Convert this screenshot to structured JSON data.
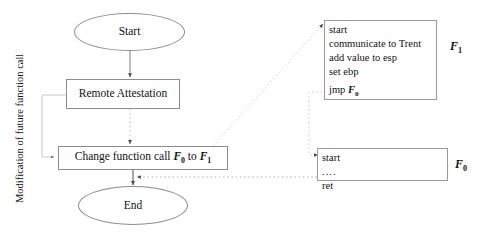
{
  "figure": {
    "side_label": "Modification of future function call",
    "background_color": "#ffffff",
    "line_color": "#8d8d8d",
    "dotted_color": "#b9b9b9",
    "text_color": "#121212"
  },
  "flow_nodes": {
    "start": {
      "label": "Start",
      "shape": "ellipse"
    },
    "remote_attestation": {
      "label": "Remote Attestation",
      "shape": "rectangle"
    },
    "change_function_call": {
      "label_prefix": "Change function call ",
      "symbol_from": "F",
      "symbol_from_sub": "0",
      "label_middle": " to ",
      "symbol_to": "F",
      "symbol_to_sub": "1",
      "shape": "rectangle"
    },
    "end": {
      "label": "End",
      "shape": "ellipse"
    }
  },
  "code_blocks": {
    "f1": {
      "name": "F",
      "name_sub": "1",
      "lines": [
        "start",
        "communicate to Trent",
        "add value to esp",
        "set ebp"
      ],
      "jump_prefix": "jmp ",
      "jump_symbol": "F",
      "jump_symbol_sub": "0"
    },
    "f0": {
      "name": "F",
      "name_sub": "0",
      "lines": [
        "start",
        "....",
        "ret"
      ]
    }
  },
  "connectors": [
    {
      "name": "start-to-remote-attestation",
      "style": "solid",
      "arrow": true
    },
    {
      "name": "remote-attestation-to-change",
      "style": "dotted",
      "arrow": true
    },
    {
      "name": "remote-attestation-bracket-to-change",
      "style": "solid",
      "arrow": true
    },
    {
      "name": "change-to-end",
      "style": "solid",
      "arrow": true
    },
    {
      "name": "change-to-f1-block",
      "style": "dotted",
      "arrow": true
    },
    {
      "name": "f1-jmp-to-f0-block",
      "style": "dotted",
      "arrow": true
    },
    {
      "name": "f0-ret-to-end",
      "style": "dotted",
      "arrow": true
    }
  ]
}
